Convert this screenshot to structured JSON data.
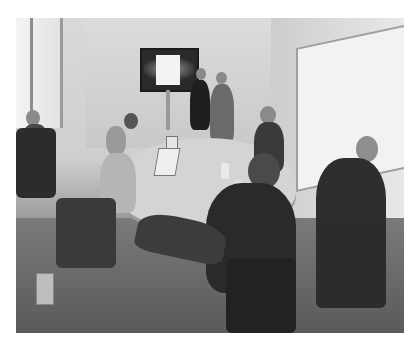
{
  "image": {
    "description": "Grayscale photo of a small conference room meeting: people seated around a table with laptops, two people standing by a wall-mounted TV screen, a whiteboard on the right wall, window on the left.",
    "palette": {
      "wall": "#d6d6d6",
      "floor": "#5e5e5e",
      "dark_clothing": "#2f2f2f",
      "screen": "#f3f3f3"
    },
    "elements": {
      "tv": "wall-mounted-tv",
      "whiteboard": "whiteboard",
      "window": "window",
      "table": "conference-table",
      "people_count": 8
    }
  }
}
